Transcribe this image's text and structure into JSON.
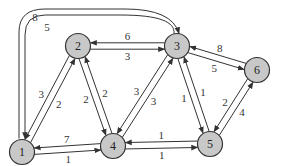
{
  "colors": {
    "node_fill": "#c8c8c8",
    "stroke": "#333333",
    "background": "#ffffff"
  },
  "nodes": [
    {
      "id": "1",
      "label": "1"
    },
    {
      "id": "2",
      "label": "2"
    },
    {
      "id": "3",
      "label": "3"
    },
    {
      "id": "4",
      "label": "4"
    },
    {
      "id": "5",
      "label": "5"
    },
    {
      "id": "6",
      "label": "6"
    }
  ],
  "edges": [
    {
      "from": "1",
      "to": "2",
      "weight": "2"
    },
    {
      "from": "2",
      "to": "1",
      "weight": "3"
    },
    {
      "from": "2",
      "to": "3",
      "weight": "3"
    },
    {
      "from": "3",
      "to": "2",
      "weight": "6"
    },
    {
      "from": "2",
      "to": "4",
      "weight": "2"
    },
    {
      "from": "4",
      "to": "2",
      "weight": "2"
    },
    {
      "from": "4",
      "to": "3",
      "weight": "3"
    },
    {
      "from": "3",
      "to": "4",
      "weight": "3"
    },
    {
      "from": "1",
      "to": "4",
      "weight": "1"
    },
    {
      "from": "4",
      "to": "1",
      "weight": "7"
    },
    {
      "from": "4",
      "to": "5",
      "weight": "1"
    },
    {
      "from": "5",
      "to": "4",
      "weight": "1"
    },
    {
      "from": "3",
      "to": "5",
      "weight": "1"
    },
    {
      "from": "5",
      "to": "3",
      "weight": "1"
    },
    {
      "from": "3",
      "to": "6",
      "weight": "5"
    },
    {
      "from": "6",
      "to": "3",
      "weight": "8"
    },
    {
      "from": "5",
      "to": "6",
      "weight": "4"
    },
    {
      "from": "6",
      "to": "5",
      "weight": "2"
    },
    {
      "from": "3",
      "to": "1",
      "weight": "5",
      "curved": true
    },
    {
      "from": "1",
      "to": "3",
      "weight": "8",
      "curved": true
    }
  ]
}
